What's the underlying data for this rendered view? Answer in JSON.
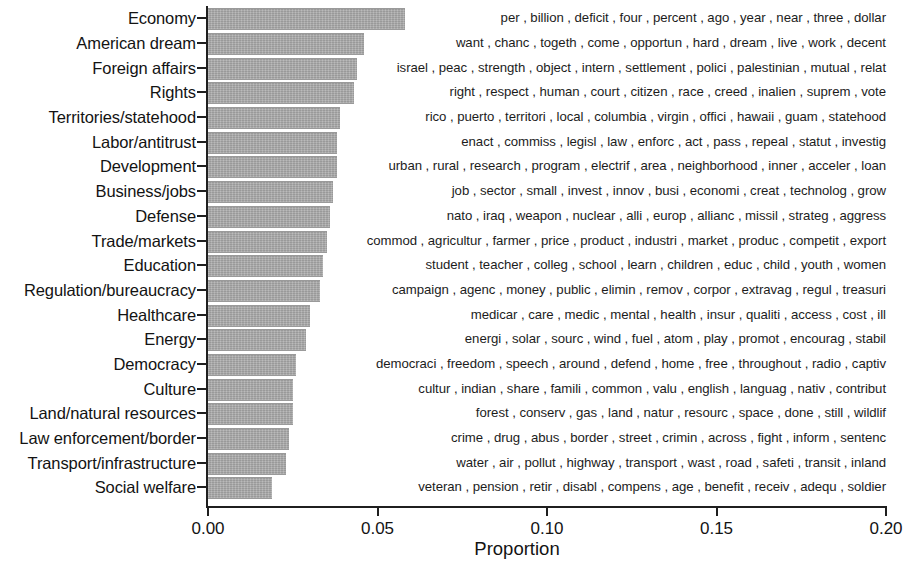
{
  "chart_data": {
    "type": "bar",
    "orientation": "horizontal",
    "title": "",
    "xlabel": "Proportion",
    "ylabel": "",
    "xlim": [
      0.0,
      0.2
    ],
    "xticks": [
      0.0,
      0.05,
      0.1,
      0.15,
      0.2
    ],
    "xtick_labels": [
      "0.00",
      "0.05",
      "0.10",
      "0.15",
      "0.20"
    ],
    "grid": false,
    "legend": null,
    "bar_color": "#a8a8a8",
    "categories": [
      "Economy",
      "American dream",
      "Foreign affairs",
      "Rights",
      "Territories/statehood",
      "Labor/antitrust",
      "Development",
      "Business/jobs",
      "Defense",
      "Trade/markets",
      "Education",
      "Regulation/bureaucracy",
      "Healthcare",
      "Energy",
      "Democracy",
      "Culture",
      "Land/natural resources",
      "Law enforcement/border",
      "Transport/infrastructure",
      "Social welfare"
    ],
    "values": [
      0.058,
      0.046,
      0.044,
      0.043,
      0.039,
      0.038,
      0.038,
      0.037,
      0.036,
      0.035,
      0.034,
      0.033,
      0.03,
      0.029,
      0.026,
      0.025,
      0.025,
      0.024,
      0.023,
      0.019
    ],
    "annotations": [
      "per , billion , deficit , four , percent , ago , year , near , three , dollar",
      "want , chanc , togeth , come , opportun , hard , dream , live , work , decent",
      "israel , peac , strength , object , intern , settlement , polici , palestinian , mutual , relat",
      "right , respect , human , court , citizen , race , creed , inalien , suprem , vote",
      "rico , puerto , territori , local , columbia , virgin , offici , hawaii , guam , statehood",
      "enact , commiss , legisl , law , enforc , act , pass , repeal , statut , investig",
      "urban , rural , research , program , electrif , area , neighborhood , inner , acceler , loan",
      "job , sector , small , invest , innov , busi , economi , creat , technolog , grow",
      "nato , iraq , weapon , nuclear , alli , europ , allianc , missil , strateg , aggress",
      "commod , agricultur , farmer , price , product , industri , market , produc , competit , export",
      "student , teacher , colleg , school , learn , children , educ , child , youth , women",
      "campaign , agenc , money , public , elimin , remov , corpor , extravag , regul , treasuri",
      "medicar , care , medic , mental , health , insur , qualiti , access , cost , ill",
      "energi , solar , sourc , wind , fuel , atom , play , promot , encourag , stabil",
      "democraci , freedom , speech , around , defend , home , free , throughout , radio , captiv",
      "cultur , indian , share , famili , common , valu , english , languag , nativ , contribut",
      "forest , conserv , gas , land , natur , resourc , space , done , still , wildlif",
      "crime , drug , abus , border , street , crimin , across , fight , inform , sentenc",
      "water , air , pollut , highway , transport , wast , road , safeti , transit , inland",
      "veteran , pension , retir , disabl , compens , age , benefit , receiv , adequ , soldier"
    ]
  }
}
